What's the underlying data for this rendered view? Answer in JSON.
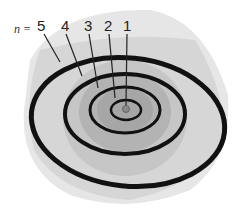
{
  "diagram": {
    "prefix": "n =",
    "shells": [
      {
        "n": "5",
        "label_x": 37
      },
      {
        "n": "4",
        "label_x": 61
      },
      {
        "n": "3",
        "label_x": 84
      },
      {
        "n": "2",
        "label_x": 104
      },
      {
        "n": "1",
        "label_x": 123
      }
    ],
    "colors": {
      "orbit": "#111111",
      "outer_sphere": "#dcdcdc",
      "mid_sphere": "#c4c4c4",
      "inner_sphere": "#a9a9a9",
      "nucleus": "#8a8a8a"
    }
  }
}
